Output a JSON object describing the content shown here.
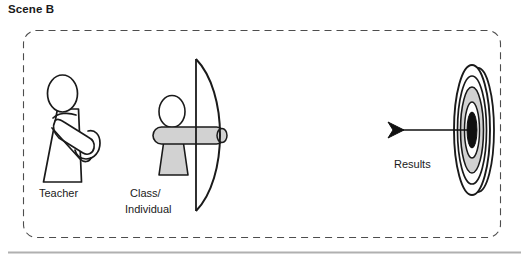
{
  "scene": {
    "title": "Scene B"
  },
  "diagram": {
    "type": "conceptual-archery-scene",
    "container": {
      "style": "dashed-rounded-box"
    },
    "figures": [
      {
        "id": "teacher",
        "name": "teacher-figure",
        "label": "Teacher",
        "style": "white-outline-stick-figure-arms-crossed"
      },
      {
        "id": "archer",
        "name": "archer-figure",
        "label_line1": "Class/",
        "label_line2": "Individual",
        "style": "gray-filled-figure-with-bow"
      },
      {
        "id": "target",
        "name": "target-figure",
        "label": "Results",
        "style": "archery-target-with-arrow-in-bullseye"
      }
    ],
    "arrow": {
      "name": "arrow",
      "direction": "right",
      "hits": "bullseye"
    }
  },
  "colors": {
    "ink": "#1a1a1a",
    "gray_fill": "#d2d2d2",
    "bullseye": "#101010",
    "dashed_border": "#4d4d4d",
    "footer_rule": "#b0b0b0",
    "page_background": "#ffffff"
  },
  "footer": {
    "rule": "horizontal-divider"
  }
}
